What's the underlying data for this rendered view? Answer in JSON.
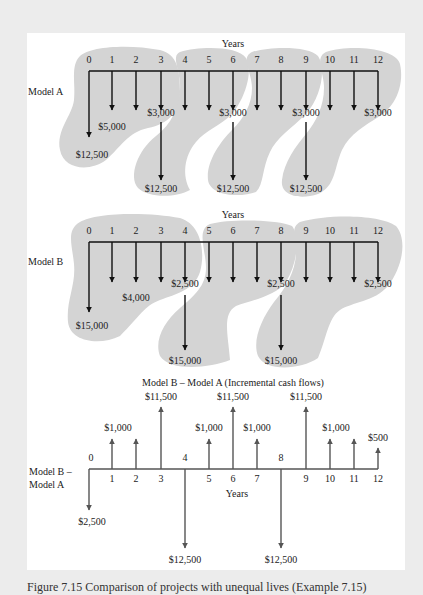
{
  "figure": {
    "caption": "Figure 7.15   Comparison of projects with unequal lives (Example 7.15)",
    "colors": {
      "page_background": "#ececec",
      "panel_background": "#ffffff",
      "blob_fill": "#d4d4d4",
      "arrow_black": "#111111",
      "arrow_gray": "#555555",
      "text": "#222222"
    }
  },
  "tick_x": [
    89,
    112,
    136,
    161,
    185,
    209,
    233,
    257,
    281,
    306,
    330,
    354,
    378
  ],
  "model_a": {
    "label": "Model A",
    "axis_label": "Years",
    "years": [
      "0",
      "1",
      "2",
      "3",
      "4",
      "5",
      "6",
      "7",
      "8",
      "9",
      "10",
      "11",
      "12"
    ],
    "cash_flows": [
      {
        "year": 0,
        "direction": "down",
        "amount": "$12,500",
        "show_label": true
      },
      {
        "year": 1,
        "direction": "down",
        "amount": "$5,000",
        "show_label": true
      },
      {
        "year": 2,
        "direction": "down",
        "amount": "$5,000",
        "show_label": false
      },
      {
        "year": 3,
        "direction": "down",
        "amount": "$3,000",
        "show_label": true
      },
      {
        "year": 3,
        "direction": "down",
        "amount": "$12,500",
        "show_label": true,
        "replacement": true
      },
      {
        "year": 4,
        "direction": "down",
        "amount": "$5,000",
        "show_label": false
      },
      {
        "year": 5,
        "direction": "down",
        "amount": "$5,000",
        "show_label": false
      },
      {
        "year": 6,
        "direction": "down",
        "amount": "$3,000",
        "show_label": true
      },
      {
        "year": 6,
        "direction": "down",
        "amount": "$12,500",
        "show_label": true,
        "replacement": true
      },
      {
        "year": 7,
        "direction": "down",
        "amount": "$5,000",
        "show_label": false
      },
      {
        "year": 8,
        "direction": "down",
        "amount": "$5,000",
        "show_label": false
      },
      {
        "year": 9,
        "direction": "down",
        "amount": "$3,000",
        "show_label": true
      },
      {
        "year": 9,
        "direction": "down",
        "amount": "$12,500",
        "show_label": true,
        "replacement": true
      },
      {
        "year": 10,
        "direction": "down",
        "amount": "$5,000",
        "show_label": false
      },
      {
        "year": 11,
        "direction": "down",
        "amount": "$5,000",
        "show_label": false
      },
      {
        "year": 12,
        "direction": "down",
        "amount": "$3,000",
        "show_label": true
      }
    ],
    "labels": {
      "initial": "$12,500",
      "annual": "$5,000",
      "salvage_net": "$3,000",
      "replacement": "$12,500"
    }
  },
  "model_b": {
    "label": "Model B",
    "axis_label": "Years",
    "years": [
      "0",
      "1",
      "2",
      "3",
      "4",
      "5",
      "6",
      "7",
      "8",
      "9",
      "10",
      "11",
      "12"
    ],
    "cash_flows": [
      {
        "year": 0,
        "direction": "down",
        "amount": "$15,000",
        "show_label": true
      },
      {
        "year": 1,
        "direction": "down",
        "amount": "$4,000",
        "show_label": false
      },
      {
        "year": 2,
        "direction": "down",
        "amount": "$4,000",
        "show_label": true
      },
      {
        "year": 3,
        "direction": "down",
        "amount": "$4,000",
        "show_label": false
      },
      {
        "year": 4,
        "direction": "down",
        "amount": "$2,500",
        "show_label": true
      },
      {
        "year": 4,
        "direction": "down",
        "amount": "$15,000",
        "show_label": true,
        "replacement": true
      },
      {
        "year": 5,
        "direction": "down",
        "amount": "$4,000",
        "show_label": false
      },
      {
        "year": 6,
        "direction": "down",
        "amount": "$4,000",
        "show_label": false
      },
      {
        "year": 7,
        "direction": "down",
        "amount": "$4,000",
        "show_label": false
      },
      {
        "year": 8,
        "direction": "down",
        "amount": "$2,500",
        "show_label": true
      },
      {
        "year": 8,
        "direction": "down",
        "amount": "$15,000",
        "show_label": true,
        "replacement": true
      },
      {
        "year": 9,
        "direction": "down",
        "amount": "$4,000",
        "show_label": false
      },
      {
        "year": 10,
        "direction": "down",
        "amount": "$4,000",
        "show_label": false
      },
      {
        "year": 11,
        "direction": "down",
        "amount": "$4,000",
        "show_label": false
      },
      {
        "year": 12,
        "direction": "down",
        "amount": "$2,500",
        "show_label": true
      }
    ],
    "labels": {
      "initial": "$15,000",
      "annual": "$4,000",
      "salvage_net": "$2,500",
      "replacement": "$15,000"
    }
  },
  "incremental": {
    "title": "Model B – Model A (Incremental cash flows)",
    "label_line1": "Model B –",
    "label_line2": "Model A",
    "axis_label": "Years",
    "years": [
      "0",
      "1",
      "2",
      "3",
      "4",
      "5",
      "6",
      "7",
      "8",
      "9",
      "10",
      "11",
      "12"
    ],
    "cash_flows": [
      {
        "year": 0,
        "direction": "down",
        "amount": "$2,500"
      },
      {
        "year": 1,
        "direction": "up",
        "amount": "$1,000"
      },
      {
        "year": 2,
        "direction": "up",
        "amount": "$1,000"
      },
      {
        "year": 3,
        "direction": "up",
        "amount": "$11,500"
      },
      {
        "year": 4,
        "direction": "down",
        "amount": "$12,500"
      },
      {
        "year": 5,
        "direction": "up",
        "amount": "$1,000"
      },
      {
        "year": 6,
        "direction": "up",
        "amount": "$11,500"
      },
      {
        "year": 7,
        "direction": "up",
        "amount": "$1,000"
      },
      {
        "year": 8,
        "direction": "down",
        "amount": "$12,500"
      },
      {
        "year": 9,
        "direction": "up",
        "amount": "$11,500"
      },
      {
        "year": 10,
        "direction": "up",
        "amount": "$1,000"
      },
      {
        "year": 11,
        "direction": "up",
        "amount": "$1,000"
      },
      {
        "year": 12,
        "direction": "up",
        "amount": "$500"
      }
    ]
  }
}
